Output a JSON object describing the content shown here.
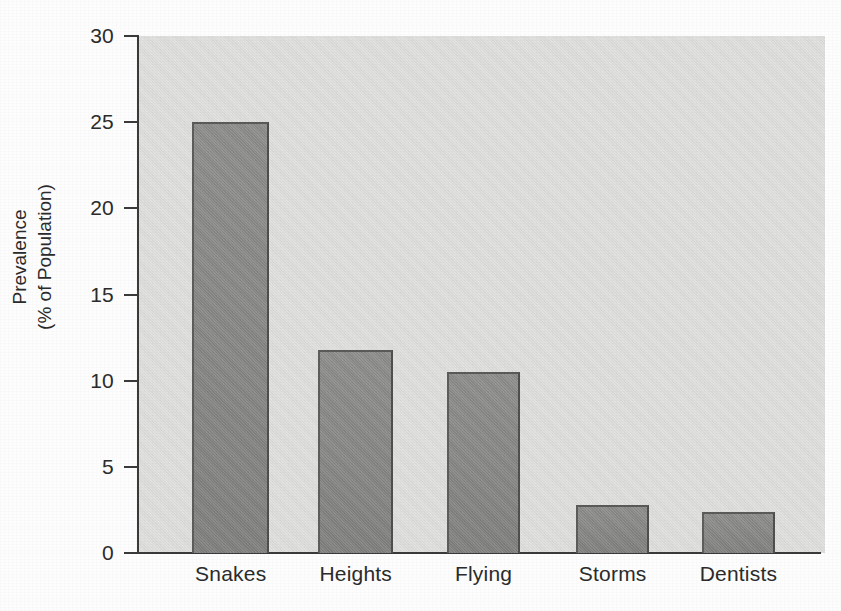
{
  "chart_data": {
    "type": "bar",
    "title": "",
    "subtitle": "",
    "xlabel": "",
    "ylabel_lines": [
      "Prevalence",
      "(% of Population)"
    ],
    "ylabel": "Prevalence (% of Population)",
    "categories": [
      "Snakes",
      "Heights",
      "Flying",
      "Storms",
      "Dentists"
    ],
    "values": [
      25.0,
      11.8,
      10.5,
      2.8,
      2.4
    ],
    "ylim": [
      0,
      30
    ],
    "y_ticks": [
      0,
      5,
      10,
      15,
      20,
      25,
      30
    ],
    "y_tick_labels": [
      "0",
      "5",
      "10",
      "15",
      "20",
      "25",
      "30"
    ],
    "grid": false,
    "legend": null,
    "units": "percent of population",
    "bar_color": "#8a8a88",
    "bar_edge_color": "#535351",
    "plot_background": "#dcdcda",
    "axis_color": "#3a3a3a",
    "text_color": "#2b2b2b"
  },
  "bars": [
    {
      "category": "Snakes",
      "value": 25.0,
      "left_pct": 7.9,
      "width_pct": 11.2
    },
    {
      "category": "Heights",
      "value": 11.8,
      "left_pct": 26.2,
      "width_pct": 10.9
    },
    {
      "category": "Flying",
      "value": 10.5,
      "left_pct": 45.0,
      "width_pct": 10.6
    },
    {
      "category": "Storms",
      "value": 2.8,
      "left_pct": 63.8,
      "width_pct": 10.6
    },
    {
      "category": "Dentists",
      "value": 2.4,
      "left_pct": 82.1,
      "width_pct": 10.6
    }
  ],
  "x_label_positions": [
    {
      "label": "Snakes",
      "center_pct": 13.5
    },
    {
      "label": "Heights",
      "center_pct": 31.7
    },
    {
      "label": "Flying",
      "center_pct": 50.3
    },
    {
      "label": "Storms",
      "center_pct": 69.1
    },
    {
      "label": "Dentists",
      "center_pct": 87.4
    }
  ]
}
